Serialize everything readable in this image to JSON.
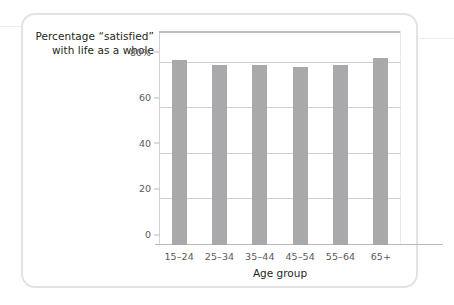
{
  "figure": {
    "title_line1": "Percentage “satisfied”",
    "title_line2": "with life as a whole",
    "bar_color": "#a9a9ab",
    "grid_color": "#cfcfd2",
    "axis_color": "#b9b9bc",
    "card_border_color": "#e3e3e5"
  },
  "chart_data": {
    "type": "bar",
    "title": "Percentage “satisfied” with life as a whole",
    "xlabel": "Age group",
    "ylabel": "",
    "categories": [
      "15–24",
      "25–34",
      "35–44",
      "45–54",
      "55–64",
      "65+"
    ],
    "values": [
      81,
      79,
      79,
      78,
      79,
      82
    ],
    "ylim": [
      0,
      93
    ],
    "yticks": [
      0,
      20,
      40,
      60,
      80
    ],
    "ytick_labels": [
      "0",
      "20",
      "40",
      "60",
      "80%"
    ],
    "grid": true,
    "grid_axis": "y",
    "legend": false,
    "series": [
      {
        "name": "Percentage satisfied with life as a whole",
        "values": [
          81,
          79,
          79,
          78,
          79,
          82
        ]
      }
    ]
  },
  "axes": {
    "x_title": "Age group",
    "y_ticks": [
      {
        "value": 80,
        "label": "80%"
      },
      {
        "value": 60,
        "label": "60"
      },
      {
        "value": 40,
        "label": "40"
      },
      {
        "value": 20,
        "label": "20"
      },
      {
        "value": 0,
        "label": "0"
      }
    ]
  }
}
